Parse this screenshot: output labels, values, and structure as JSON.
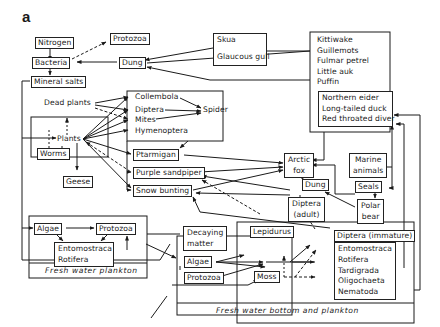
{
  "figure": {
    "panel_label": "a"
  },
  "nodes": {
    "nitrogen": "Nitrogen",
    "protozoa_top": "Protozoa",
    "bacteria": "Bacteria",
    "dung_top": "Dung",
    "mineral_salts": "Mineral salts",
    "skua": "Skua",
    "glaucous_gull": "Glaucous gull",
    "seabirds": [
      "Kittiwake",
      "Guillemots",
      "Fulmar petrel",
      "Little auk",
      "Puffin"
    ],
    "ducks": [
      "Northern eider",
      "Long-tailed duck",
      "Red throated diver"
    ],
    "dead_plants": "Dead plants",
    "plants": "Plants",
    "worms": "Worms",
    "geese": "Geese",
    "collembola": "Collembola",
    "diptera": "Diptera",
    "mites": "Mites",
    "hymenoptera": "Hymenoptera",
    "spider": "Spider",
    "ptarmigan": "Ptarmigan",
    "purple_sandpiper": "Purple sandpiper",
    "snow_bunting": "Snow bunting",
    "arctic_fox": [
      "Arctic",
      "fox"
    ],
    "marine_animals": [
      "Marine",
      "animals"
    ],
    "dung_mid": "Dung",
    "seals": "Seals",
    "polar_bear": [
      "Polar",
      "bear"
    ],
    "diptera_adult": [
      "Diptera",
      "(adult)"
    ],
    "fw_algae": "Algae",
    "fw_protozoa": "Protozoa",
    "fw_zoo": [
      "Entomostraca",
      "Rotifera"
    ],
    "fw_plankton_caption": "Fresh water plankton",
    "decaying_matter": [
      "Decaying",
      "matter"
    ],
    "lepidurus": "Lepidurus",
    "bottom_algae": "Algae",
    "bottom_protozoa": "Protozoa",
    "moss": "Moss",
    "diptera_immature": "Diptera (immature)",
    "bottom_fauna": [
      "Entomostraca",
      "Rotifera",
      "Tardigrada",
      "Oligochaeta",
      "Nematoda"
    ],
    "fw_bottom_caption": "Fresh water bottom and plankton"
  }
}
